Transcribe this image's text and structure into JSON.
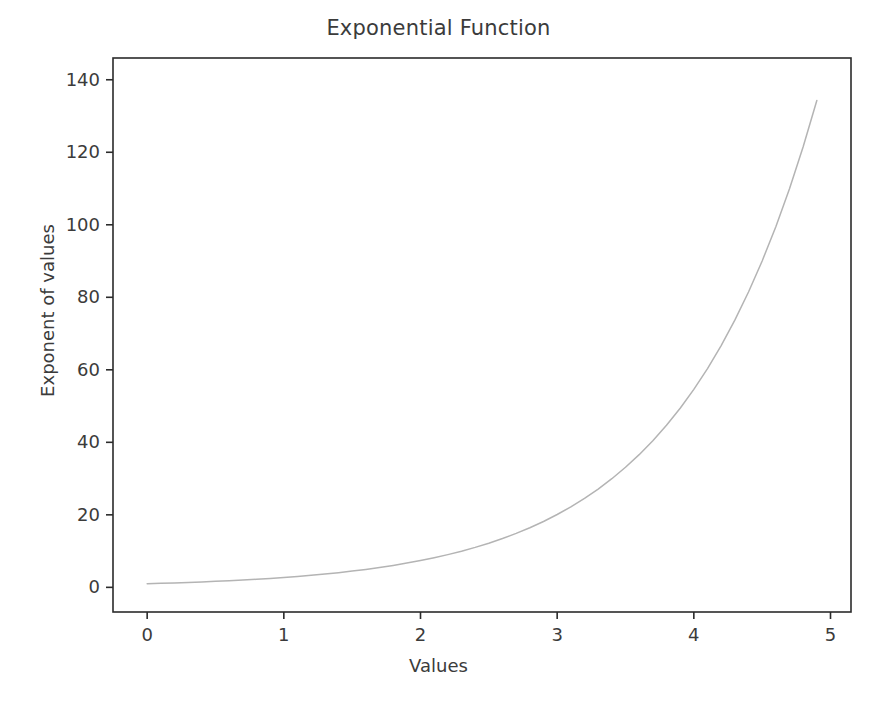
{
  "chart_data": {
    "type": "line",
    "title": "Exponential Function",
    "xlabel": "Values",
    "ylabel": "Exponent of values",
    "grid": false,
    "legend": null,
    "xlim": [
      -0.25,
      5.15
    ],
    "ylim": [
      -6.8,
      146
    ],
    "xticks": [
      0,
      1,
      2,
      3,
      4,
      5
    ],
    "xtick_labels": [
      "0",
      "1",
      "2",
      "3",
      "4",
      "5"
    ],
    "yticks": [
      0,
      20,
      40,
      60,
      80,
      100,
      120,
      140
    ],
    "ytick_labels": [
      "0",
      "20",
      "40",
      "60",
      "80",
      "100",
      "120",
      "140"
    ],
    "line_color": "#b4b4b4",
    "line_width": 1.5,
    "axis_color": "#2b2b2b",
    "text_color": "#3b3b3b",
    "background_color": "#ffffff",
    "series": [
      {
        "name": "exp(x)",
        "x": [
          0.0,
          0.1,
          0.2,
          0.3,
          0.4,
          0.5,
          0.6,
          0.7,
          0.8,
          0.9,
          1.0,
          1.1,
          1.2,
          1.3,
          1.4,
          1.5,
          1.6,
          1.7,
          1.8,
          1.9,
          2.0,
          2.1,
          2.2,
          2.3,
          2.4,
          2.5,
          2.6,
          2.7,
          2.8,
          2.9,
          3.0,
          3.1,
          3.2,
          3.3,
          3.4,
          3.5,
          3.6,
          3.7,
          3.8,
          3.9,
          4.0,
          4.1,
          4.2,
          4.3,
          4.4,
          4.5,
          4.6,
          4.7,
          4.8,
          4.9
        ],
        "y": [
          1.0,
          1.11,
          1.22,
          1.35,
          1.49,
          1.65,
          1.82,
          2.01,
          2.23,
          2.46,
          2.72,
          3.0,
          3.32,
          3.67,
          4.06,
          4.48,
          4.95,
          5.47,
          6.05,
          6.69,
          7.39,
          8.17,
          9.03,
          9.97,
          11.02,
          12.18,
          13.46,
          14.88,
          16.44,
          18.17,
          20.09,
          22.2,
          24.53,
          27.11,
          29.96,
          33.12,
          36.6,
          40.45,
          44.7,
          49.4,
          54.6,
          60.34,
          66.69,
          73.7,
          81.45,
          90.02,
          99.48,
          109.95,
          121.51,
          134.29
        ]
      }
    ]
  }
}
